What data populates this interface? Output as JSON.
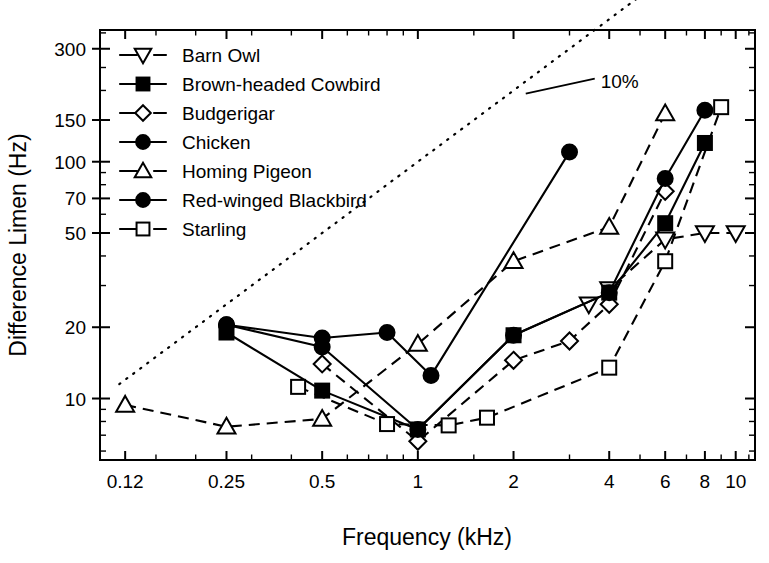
{
  "chart_data": {
    "type": "line",
    "title": "",
    "xlabel": "Frequency (kHz)",
    "ylabel": "Difference Limen (Hz)",
    "xscale": "log",
    "yscale": "log",
    "xlim": [
      0.1,
      11.5
    ],
    "ylim": [
      5.5,
      360
    ],
    "grid": false,
    "legend_position": "top-left-inside",
    "x_ticks": [
      "0.12",
      "0.25",
      "0.5",
      "1",
      "2",
      "4",
      "6",
      "8",
      "10"
    ],
    "x_tick_values": [
      0.12,
      0.25,
      0.5,
      1,
      2,
      4,
      6,
      8,
      10
    ],
    "y_ticks": [
      "300",
      "150",
      "100",
      "70",
      "50",
      "20",
      "10"
    ],
    "y_tick_values": [
      300,
      150,
      100,
      70,
      50,
      20,
      10
    ],
    "annotations": [
      {
        "text": "10%",
        "x": 3.55,
        "y": 220,
        "note": "label for dotted reference line representing 10% of frequency"
      }
    ],
    "reference_line": {
      "label": "10%",
      "style": "dotted",
      "x": [
        0.115,
        6.2
      ],
      "y": [
        11.5,
        620
      ]
    },
    "series": [
      {
        "name": "Barn Owl",
        "marker": "triangle-down-open",
        "line": "dashed",
        "x": [
          3.45,
          4.0,
          6.0,
          8.0,
          10.0
        ],
        "y": [
          25.0,
          29.0,
          47.0,
          50.0,
          50.0
        ]
      },
      {
        "name": "Brown-headed Cowbird",
        "marker": "square-filled",
        "line": "solid",
        "x": [
          0.25,
          0.5,
          1.0,
          2.0,
          4.0,
          6.0,
          8.0
        ],
        "y": [
          19.0,
          10.8,
          7.4,
          18.5,
          28.0,
          55.0,
          120.0
        ]
      },
      {
        "name": "Budgerigar",
        "marker": "diamond-open",
        "line": "dashed",
        "x": [
          0.5,
          1.0,
          2.0,
          3.0,
          4.0,
          6.0
        ],
        "y": [
          14.0,
          6.6,
          14.5,
          17.5,
          25.0,
          75.0
        ]
      },
      {
        "name": "Chicken",
        "marker": "circle-filled",
        "line": "solid",
        "x": [
          0.25,
          0.5,
          0.8,
          1.1,
          3.0
        ],
        "y": [
          20.5,
          18.0,
          19.0,
          12.5,
          110.0
        ]
      },
      {
        "name": "Homing Pigeon",
        "marker": "triangle-up-open",
        "line": "dashed",
        "x": [
          0.12,
          0.25,
          0.5,
          1.0,
          2.0,
          4.0,
          6.0
        ],
        "y": [
          9.4,
          7.6,
          8.2,
          17.0,
          38.0,
          53.0,
          160.0
        ]
      },
      {
        "name": "Red-winged Blackbird",
        "marker": "circle-filled",
        "line": "solid",
        "x": [
          0.25,
          0.5,
          1.0,
          2.0,
          4.0,
          6.0,
          8.0
        ],
        "y": [
          20.5,
          16.5,
          7.4,
          18.5,
          28.0,
          85.0,
          165.0
        ]
      },
      {
        "name": "Starling",
        "marker": "square-open",
        "line": "dashed",
        "x": [
          0.42,
          0.8,
          1.25,
          1.65,
          4.0,
          6.0,
          9.0
        ],
        "y": [
          11.2,
          7.8,
          7.7,
          8.3,
          13.5,
          38.0,
          170.0
        ]
      }
    ]
  },
  "legend": {
    "items": [
      {
        "label": "Barn Owl",
        "marker": "triangle-down-open",
        "line": "dashed"
      },
      {
        "label": "Brown-headed Cowbird",
        "marker": "square-filled",
        "line": "solid"
      },
      {
        "label": "Budgerigar",
        "marker": "diamond-open",
        "line": "dashed"
      },
      {
        "label": "Chicken",
        "marker": "circle-filled",
        "line": "solid"
      },
      {
        "label": "Homing Pigeon",
        "marker": "triangle-up-open",
        "line": "dashed"
      },
      {
        "label": "Red-winged Blackbird",
        "marker": "circle-filled",
        "line": "solid"
      },
      {
        "label": "Starling",
        "marker": "square-open",
        "line": "dashed"
      }
    ]
  },
  "colors": {
    "ink": "#000000",
    "background": "#ffffff"
  }
}
